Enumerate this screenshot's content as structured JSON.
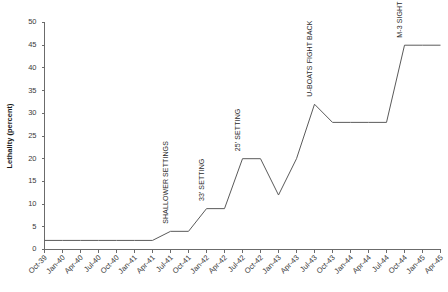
{
  "chart_data": {
    "type": "line",
    "title": "",
    "xlabel": "",
    "ylabel": "Lethality (percent)",
    "ylim": [
      0,
      50
    ],
    "yticks": [
      0,
      5,
      10,
      15,
      20,
      25,
      30,
      35,
      40,
      45,
      50
    ],
    "grid": false,
    "legend": "none",
    "categories": [
      "Oct-39",
      "Jan-40",
      "Apr-40",
      "Jul-40",
      "Oct-40",
      "Jan-41",
      "Apr-41",
      "Jul-41",
      "Oct-41",
      "Jan-42",
      "Apr-42",
      "Jul-42",
      "Oct-42",
      "Jan-43",
      "Apr-43",
      "Jul-43",
      "Oct-43",
      "Jan-44",
      "Apr-44",
      "Jul-44",
      "Oct-44",
      "Jan-45",
      "Apr-45"
    ],
    "values": [
      2,
      2,
      2,
      2,
      2,
      2,
      2,
      4,
      4,
      9,
      9,
      20,
      20,
      12,
      20,
      32,
      28,
      28,
      28,
      28,
      45,
      45,
      45
    ],
    "series": [
      {
        "name": "Lethality",
        "values": [
          2,
          2,
          2,
          2,
          2,
          2,
          2,
          4,
          4,
          9,
          9,
          20,
          20,
          12,
          20,
          32,
          28,
          28,
          28,
          28,
          45,
          45,
          45
        ]
      }
    ],
    "annotations": [
      {
        "text": "SHALLOWER SETTINGS",
        "x": "Jul-41",
        "y": 5
      },
      {
        "text": "33' SETTING",
        "x": "Jan-42",
        "y": 10
      },
      {
        "text": "25' SETTING",
        "x": "Jul-42",
        "y": 21
      },
      {
        "text": "U-BOATS FIGHT BACK",
        "x": "Jul-43",
        "y": 33
      },
      {
        "text": "M-3 SIGHT",
        "x": "Oct-44",
        "y": 46
      }
    ]
  },
  "colors": {
    "line": "#5a5a5a",
    "axis": "#6b6b6b",
    "text": "#2b2b2b",
    "background": "#ffffff"
  }
}
